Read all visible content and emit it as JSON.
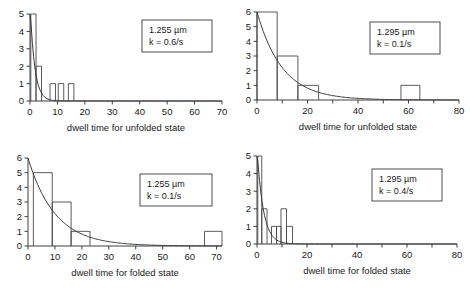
{
  "figure": {
    "panel_count": 4,
    "layout": "2x2"
  },
  "chart_data": [
    {
      "type": "bar",
      "title": "",
      "xlabel": "dwell time for unfolded state",
      "ylabel": "",
      "xlim": [
        0,
        70
      ],
      "ylim": [
        0,
        5
      ],
      "xticks": [
        0,
        10,
        20,
        30,
        40,
        50,
        60,
        70
      ],
      "xtick_labels": [
        "0",
        "10",
        "20",
        "30",
        "40",
        "50",
        "60",
        "70"
      ],
      "yticks": [
        0,
        1,
        2,
        3,
        4,
        5
      ],
      "ytick_labels": [
        "0",
        "1",
        "2",
        "3",
        "4",
        "5"
      ],
      "grid": false,
      "bins": [
        {
          "start": 0.3,
          "end": 2.2,
          "value": 5
        },
        {
          "start": 2.2,
          "end": 4.2,
          "value": 2
        },
        {
          "start": 7.3,
          "end": 9.3,
          "value": 1
        },
        {
          "start": 10.3,
          "end": 12.3,
          "value": 1
        },
        {
          "start": 14.0,
          "end": 16.0,
          "value": 1
        }
      ],
      "fit": {
        "type": "exponential",
        "amplitude": 5.6,
        "rate": 0.6
      },
      "annotation": {
        "length": "1.255 µm",
        "rate": "k = 0.6/s"
      }
    },
    {
      "type": "bar",
      "title": "",
      "xlabel": "dwell time for unfolded state",
      "ylabel": "",
      "xlim": [
        0,
        80
      ],
      "ylim": [
        0,
        6
      ],
      "xticks": [
        0,
        10,
        20,
        30,
        40,
        50,
        60,
        70,
        80
      ],
      "xtick_labels": [
        "0",
        "",
        "20",
        "",
        "40",
        "",
        "60",
        "",
        "80"
      ],
      "yticks": [
        0,
        1,
        2,
        3,
        4,
        5,
        6
      ],
      "ytick_labels": [
        "0",
        "1",
        "2",
        "3",
        "4",
        "5",
        "6"
      ],
      "grid": false,
      "bins": [
        {
          "start": 0.0,
          "end": 8.0,
          "value": 6
        },
        {
          "start": 8.0,
          "end": 16.2,
          "value": 3
        },
        {
          "start": 16.2,
          "end": 24.4,
          "value": 1
        },
        {
          "start": 57.0,
          "end": 64.5,
          "value": 1
        }
      ],
      "fit": {
        "type": "exponential",
        "amplitude": 6.0,
        "rate": 0.1
      },
      "annotation": {
        "length": "1.295 µm",
        "rate": "k = 0.1/s"
      }
    },
    {
      "type": "bar",
      "title": "",
      "xlabel": "dwell time for folded state",
      "ylabel": "",
      "xlim": [
        0,
        72
      ],
      "ylim": [
        0,
        6
      ],
      "xticks": [
        0,
        10,
        20,
        30,
        40,
        50,
        60,
        70
      ],
      "xtick_labels": [
        "0",
        "10",
        "20",
        "30",
        "40",
        "50",
        "60",
        "70"
      ],
      "yticks": [
        0,
        1,
        2,
        3,
        4,
        5,
        6
      ],
      "ytick_labels": [
        "0",
        "1",
        "2",
        "3",
        "4",
        "5",
        "6"
      ],
      "grid": false,
      "bins": [
        {
          "start": 2.0,
          "end": 9.0,
          "value": 5
        },
        {
          "start": 9.0,
          "end": 16.0,
          "value": 3
        },
        {
          "start": 16.0,
          "end": 23.0,
          "value": 1
        },
        {
          "start": 65.5,
          "end": 72.0,
          "value": 1
        }
      ],
      "fit": {
        "type": "exponential",
        "amplitude": 6.0,
        "rate": 0.1
      },
      "annotation": {
        "length": "1.255 µm",
        "rate": "k = 0.1/s"
      }
    },
    {
      "type": "bar",
      "title": "",
      "xlabel": "dwell time for folded state",
      "ylabel": "",
      "xlim": [
        0,
        80
      ],
      "ylim": [
        0,
        5
      ],
      "xticks": [
        0,
        10,
        20,
        30,
        40,
        50,
        60,
        70,
        80
      ],
      "xtick_labels": [
        "0",
        "",
        "20",
        "",
        "40",
        "",
        "60",
        "",
        "80"
      ],
      "yticks": [
        0,
        1,
        2,
        3,
        4,
        5
      ],
      "ytick_labels": [
        "0",
        "1",
        "2",
        "3",
        "4",
        "5"
      ],
      "grid": false,
      "bins": [
        {
          "start": 0.3,
          "end": 1.9,
          "value": 5
        },
        {
          "start": 1.9,
          "end": 4.0,
          "value": 2
        },
        {
          "start": 5.8,
          "end": 7.8,
          "value": 1
        },
        {
          "start": 7.8,
          "end": 9.6,
          "value": 1
        },
        {
          "start": 9.6,
          "end": 11.8,
          "value": 2
        },
        {
          "start": 11.8,
          "end": 14.2,
          "value": 1
        }
      ],
      "fit": {
        "type": "exponential",
        "amplitude": 5.4,
        "rate": 0.4
      },
      "annotation": {
        "length": "1.295 µm",
        "rate": "k = 0.4/s"
      }
    }
  ],
  "colors": {
    "axis": "#2b2b2b",
    "bar_stroke": "#4a4a4a",
    "fit_curve": "#3a3a3a",
    "background": "#ffffff",
    "text": "#1a1a1a"
  }
}
